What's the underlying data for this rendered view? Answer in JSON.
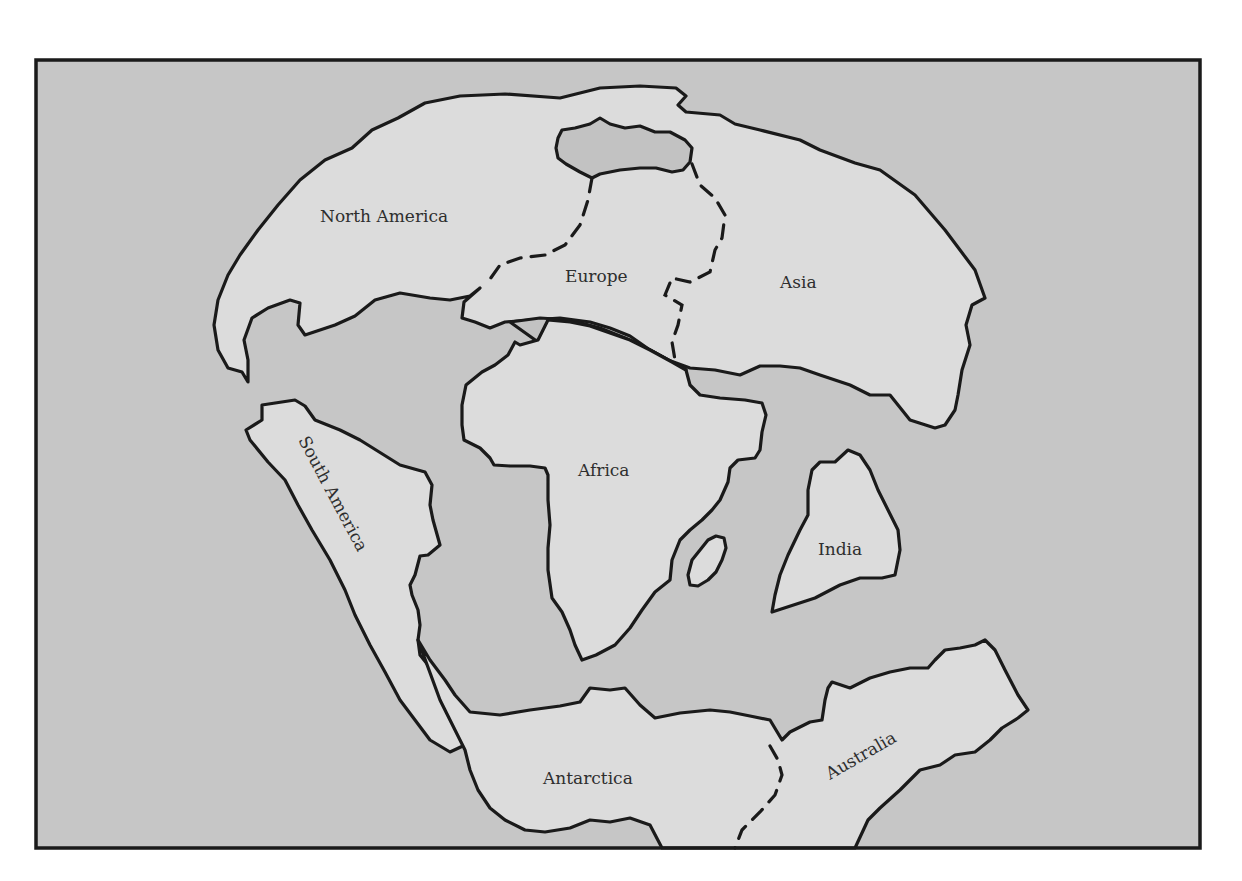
{
  "map": {
    "type": "paleogeographic map (Pangaea supercontinent)",
    "colors": {
      "ocean": "#c6c6c6",
      "land": "#dcdcdc",
      "inland_sea": "#c2c2c2",
      "outline": "#1a1a1a",
      "frame": "#1a1a1a",
      "label_text": "#2e2e2e",
      "page_background": "#ffffff"
    },
    "labels": {
      "north_america": "North America",
      "europe": "Europe",
      "asia": "Asia",
      "south_america": "South America",
      "africa": "Africa",
      "india": "India",
      "antarctica": "Antarctica",
      "australia": "Australia"
    }
  }
}
